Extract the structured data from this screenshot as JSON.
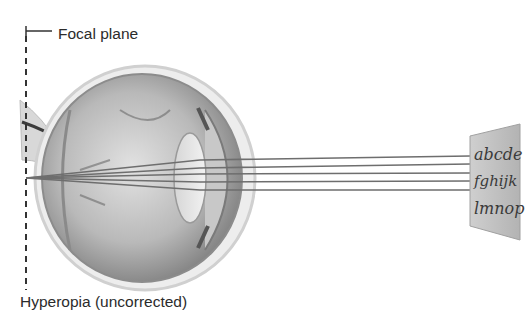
{
  "labels": {
    "focal_plane": "Focal plane",
    "condition": "Hyperopia (uncorrected)"
  },
  "eye_chart": {
    "lines": [
      "abcde",
      "fghijk",
      "lmnop"
    ]
  },
  "colors": {
    "text": "#2b2b2b",
    "ray": "#6e6e6e",
    "eye_shade": "#9a9a9a",
    "chart_panel": "#c4c4c4"
  },
  "rays": {
    "count": 5,
    "convergence_point": "behind retina, on focal plane"
  }
}
